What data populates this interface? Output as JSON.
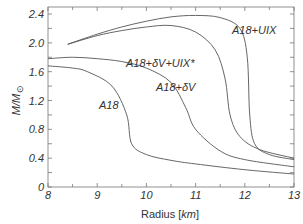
{
  "chart_data": {
    "type": "line",
    "title": "",
    "xlabel": "Radius [km]",
    "ylabel": "M/M_sun",
    "xlim": [
      8,
      13
    ],
    "ylim": [
      0,
      2.5
    ],
    "xticks": [
      "8",
      "9",
      "10",
      "11",
      "12",
      "13"
    ],
    "yticks": [
      "0",
      "0.4",
      "0.8",
      "1.2",
      "1.6",
      "2.0",
      "2.4"
    ],
    "grid": false,
    "series": [
      {
        "name": "A18+UIX",
        "x": [
          8.4,
          9,
          9.5,
          10,
          10.5,
          11,
          11.5,
          11.9,
          12.05,
          12.1,
          12.2,
          12.5,
          13
        ],
        "y": [
          1.98,
          2.12,
          2.22,
          2.3,
          2.36,
          2.38,
          2.35,
          2.2,
          1.8,
          1.0,
          0.6,
          0.45,
          0.38
        ]
      },
      {
        "name": "A18+δV+UIX*",
        "x": [
          8.4,
          9,
          9.5,
          10,
          10.5,
          11,
          11.4,
          11.6,
          11.7,
          11.9,
          12.3,
          13
        ],
        "y": [
          1.98,
          2.1,
          2.17,
          2.22,
          2.24,
          2.15,
          1.9,
          1.5,
          1.0,
          0.7,
          0.52,
          0.4
        ]
      },
      {
        "name": "A18+δV",
        "x": [
          8,
          8.5,
          9,
          9.5,
          10,
          10.5,
          10.8,
          11,
          11.5,
          12,
          13
        ],
        "y": [
          1.78,
          1.8,
          1.78,
          1.74,
          1.65,
          1.45,
          1.1,
          0.8,
          0.5,
          0.38,
          0.28
        ]
      },
      {
        "name": "A18",
        "x": [
          8,
          8.5,
          8.8,
          9.3,
          9.6,
          9.7,
          10,
          10.5,
          11,
          12,
          13
        ],
        "y": [
          1.68,
          1.65,
          1.6,
          1.4,
          1.0,
          0.6,
          0.45,
          0.37,
          0.32,
          0.24,
          0.18
        ]
      }
    ],
    "annotations": [
      "A18+UIX",
      "A18+δV+UIX*",
      "A18+δV",
      "A18"
    ]
  },
  "labels": {
    "xlabel_prefix": "Radius [",
    "xlabel_unit": "km",
    "xlabel_suffix": "]",
    "ylabel": "M/M",
    "curve_a18_uix": "A18+UIX",
    "curve_a18_dv_uix": "A18+δV+UIX*",
    "curve_a18_dv": "A18+δV",
    "curve_a18": "A18"
  }
}
